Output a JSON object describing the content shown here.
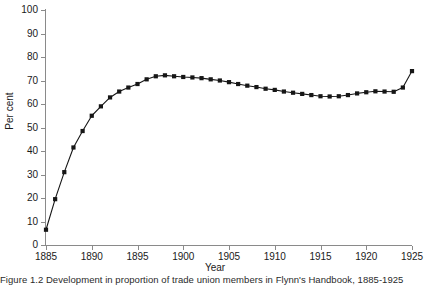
{
  "figure": {
    "caption": "Figure 1.2  Development in proportion of trade union members in Flynn's Handbook, 1885-1925"
  },
  "chart_data": {
    "type": "line",
    "title": "",
    "xlabel": "Year",
    "ylabel": "Per cent",
    "xlim": [
      1885,
      1925
    ],
    "ylim": [
      0,
      100
    ],
    "ytick_labels": [
      "0",
      "10",
      "20",
      "30",
      "40",
      "50",
      "60",
      "70",
      "80",
      "90",
      "100"
    ],
    "yticks": [
      0,
      10,
      20,
      30,
      40,
      50,
      60,
      70,
      80,
      90,
      100
    ],
    "xtick_labels": [
      "1885",
      "1890",
      "1895",
      "1900",
      "1905",
      "1910",
      "1915",
      "1920",
      "1925"
    ],
    "xticks": [
      1885,
      1890,
      1895,
      1900,
      1905,
      1910,
      1915,
      1920,
      1925
    ],
    "grid": false,
    "legend": false,
    "marker": "square",
    "line_color": "#161616",
    "marker_color": "#161616",
    "x": [
      1885,
      1886,
      1887,
      1888,
      1889,
      1890,
      1891,
      1892,
      1893,
      1894,
      1895,
      1896,
      1897,
      1898,
      1899,
      1900,
      1901,
      1902,
      1903,
      1904,
      1905,
      1906,
      1907,
      1908,
      1909,
      1910,
      1911,
      1912,
      1913,
      1914,
      1915,
      1916,
      1917,
      1918,
      1919,
      1920,
      1921,
      1922,
      1923,
      1924,
      1925
    ],
    "values": [
      6.5,
      19.5,
      31.0,
      41.5,
      48.5,
      55.0,
      59.0,
      62.8,
      65.3,
      67.0,
      68.5,
      70.5,
      71.8,
      72.2,
      71.8,
      71.5,
      71.3,
      71.0,
      70.5,
      70.0,
      69.3,
      68.5,
      67.8,
      67.2,
      66.5,
      66.0,
      65.3,
      64.8,
      64.3,
      63.8,
      63.3,
      63.2,
      63.3,
      63.8,
      64.5,
      65.0,
      65.4,
      65.3,
      65.2,
      67.0,
      74.0
    ]
  }
}
